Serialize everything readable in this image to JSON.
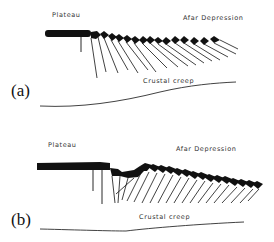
{
  "figure": {
    "panels": [
      {
        "id": "a",
        "panel_label": "(a)",
        "labels": {
          "left": "Plateau",
          "right": "Afar Depression",
          "bottom": "Crustal creep"
        }
      },
      {
        "id": "b",
        "panel_label": "(b)",
        "labels": {
          "left": "Plateau",
          "right": "Afar Depression",
          "bottom": "Crustal creep"
        }
      }
    ],
    "colors": {
      "ink": "#111111",
      "background": "#ffffff",
      "label": "#333333"
    }
  }
}
